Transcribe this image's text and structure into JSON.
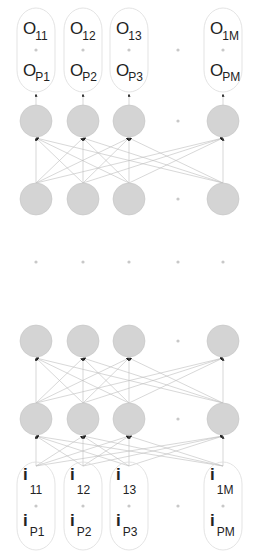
{
  "diagram": {
    "type": "multi-layer feed-forward network with grouped input/output vectors",
    "colors": {
      "node_fill": "#d4d4d4",
      "node_stroke": "#c4c4c4",
      "edge": "#bdbdbd",
      "arrow": "#1a1a1a",
      "capsule_stroke": "#dcdcdc",
      "dot": "#c8c8c8",
      "text": "#222222"
    },
    "columns_x": [
      36,
      83,
      129,
      223
    ],
    "ellipsis_x": 178,
    "node_radius": 16,
    "layers": [
      {
        "id": "top-hidden-upper",
        "y": 121
      },
      {
        "id": "top-hidden-lower",
        "y": 199
      },
      {
        "id": "bottom-hidden-upper",
        "y": 341
      },
      {
        "id": "bottom-hidden-lower",
        "y": 419
      }
    ],
    "vertical_ellipsis_row_y": 262,
    "outputs": {
      "capsule_top": 8,
      "capsule_bottom": 92,
      "groups": [
        {
          "top_main": "O",
          "top_sub": "11",
          "bottom_main": "O",
          "bottom_sub": "P1"
        },
        {
          "top_main": "O",
          "top_sub": "12",
          "bottom_main": "O",
          "bottom_sub": "P2"
        },
        {
          "top_main": "O",
          "top_sub": "13",
          "bottom_main": "O",
          "bottom_sub": "P3"
        },
        {
          "top_main": "O",
          "top_sub": "1M",
          "bottom_main": "O",
          "bottom_sub": "PM"
        }
      ]
    },
    "inputs": {
      "capsule_top": 462,
      "capsule_bottom": 550,
      "groups": [
        {
          "top_main": "i",
          "top_sub": "11",
          "bottom_main": "i",
          "bottom_sub": "P1"
        },
        {
          "top_main": "i",
          "top_sub": "12",
          "bottom_main": "i",
          "bottom_sub": "P2"
        },
        {
          "top_main": "i",
          "top_sub": "13",
          "bottom_main": "i",
          "bottom_sub": "P3"
        },
        {
          "top_main": "i",
          "top_sub": "1M",
          "bottom_main": "i",
          "bottom_sub": "PM"
        }
      ]
    }
  }
}
